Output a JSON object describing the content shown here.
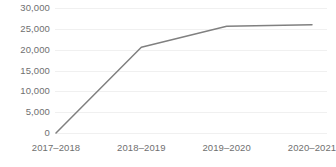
{
  "chart_data": {
    "type": "line",
    "title": "",
    "subtitle": "",
    "xlabel": "",
    "ylabel": "",
    "categories": [
      "2017–2018",
      "2018–2019",
      "2019–2020",
      "2020–2021"
    ],
    "series": [
      {
        "name": "",
        "values": [
          0,
          20600,
          25600,
          26000
        ]
      }
    ],
    "ylim": [
      0,
      30000
    ],
    "y_ticks": [
      30000,
      25000,
      20000,
      15000,
      10000,
      5000,
      0
    ],
    "y_tick_labels": [
      "30,000",
      "25,000",
      "20,000",
      "15,000",
      "10,000",
      "5,000",
      "0"
    ],
    "grid": {
      "horizontal": true,
      "vertical": false,
      "color": "#f0f0f0"
    },
    "legend": {
      "visible": false,
      "position": "none",
      "entries": []
    },
    "line_color": "#808080",
    "line_width": 1.5,
    "markers": false,
    "axis_label_color": "#6f6f6f"
  },
  "footer": {
    "caption": ""
  }
}
